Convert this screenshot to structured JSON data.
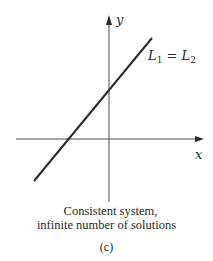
{
  "figure": {
    "panel_label": "(c)",
    "caption_line1": "Consistent system,",
    "caption_line2": "infinite number of solutions",
    "axes": {
      "x_label": "x",
      "y_label": "y"
    },
    "line": {
      "label_L": "L",
      "label_sub1": "1",
      "label_eq": " = ",
      "label_sub2": "2",
      "label_full": "L1 = L2",
      "color": "#2a2a2a"
    }
  }
}
